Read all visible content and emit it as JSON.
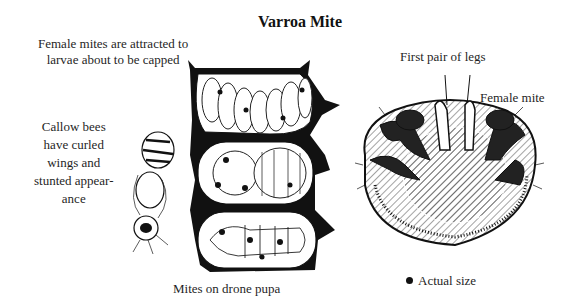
{
  "title": "Varroa Mite",
  "labels": {
    "attracted": [
      "Female mites are attracted to",
      "larvae about to be capped"
    ],
    "callow": [
      "Callow bees",
      "have curled",
      "wings and",
      "stunted appear-",
      "ance"
    ],
    "pupa": "Mites on drone pupa",
    "legs": "First pair of legs",
    "female": "Female mite",
    "actual_size": "Actual size"
  },
  "figures": {
    "comb": "brood-comb-cross-section",
    "bee": "callow-bee-deformed",
    "mite": "female-varroa-mite-ventral"
  },
  "colors": {
    "ink": "#111111",
    "paper": "#ffffff",
    "shade": "#555555"
  }
}
